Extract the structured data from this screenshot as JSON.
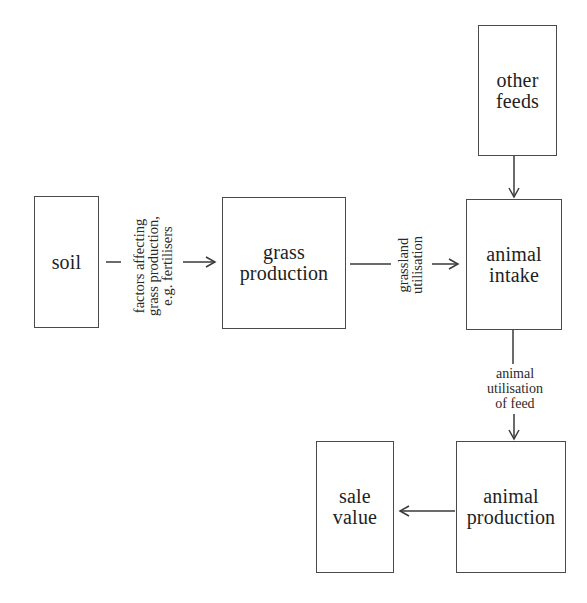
{
  "diagram": {
    "type": "flowchart",
    "nodes": {
      "soil": {
        "label": "soil"
      },
      "grass_production": {
        "label": "grass\nproduction"
      },
      "other_feeds": {
        "label": "other\nfeeds"
      },
      "animal_intake": {
        "label": "animal\nintake"
      },
      "animal_production": {
        "label": "animal\nproduction"
      },
      "sale_value": {
        "label": "sale\nvalue"
      }
    },
    "edges": {
      "soil_to_grass": {
        "from": "soil",
        "to": "grass_production",
        "label": "factors affecting\ngrass production,\ne.g. fertilisers"
      },
      "grass_to_intake": {
        "from": "grass_production",
        "to": "animal_intake",
        "label": "grassland\nutilisation"
      },
      "feeds_to_intake": {
        "from": "other_feeds",
        "to": "animal_intake",
        "label": ""
      },
      "intake_to_production": {
        "from": "animal_intake",
        "to": "animal_production",
        "label": "animal\nutilisation\nof feed"
      },
      "production_to_sale": {
        "from": "animal_production",
        "to": "sale_value",
        "label": ""
      }
    },
    "colors": {
      "line": "#3a3a3a",
      "text": "#1e1e1e",
      "background": "#ffffff"
    }
  }
}
